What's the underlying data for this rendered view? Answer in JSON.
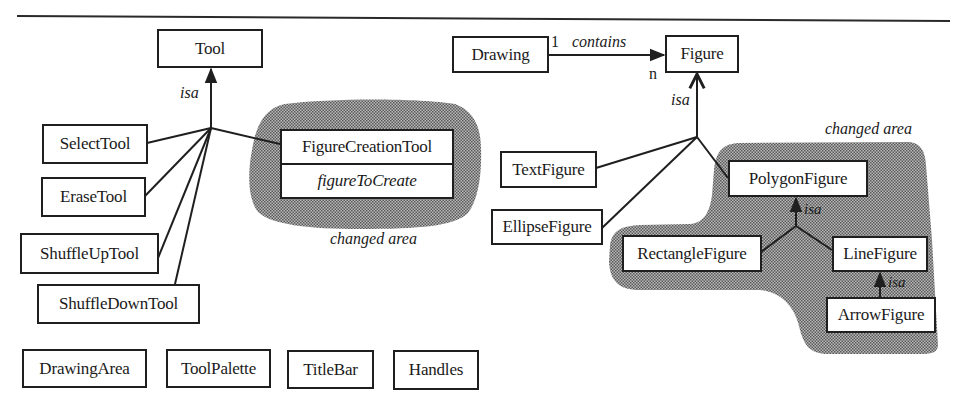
{
  "colors": {
    "ink": "#1f1f1f",
    "changed_area_fill": "#8a8a8a",
    "background": "#ffffff"
  },
  "tool_hierarchy": {
    "root": {
      "label": "Tool"
    },
    "relation_label": "isa",
    "subclasses": [
      {
        "label": "SelectTool"
      },
      {
        "label": "EraseTool"
      },
      {
        "label": "ShuffleUpTool"
      },
      {
        "label": "ShuffleDownTool"
      }
    ],
    "changed_class": {
      "label": "FigureCreationTool",
      "attribute": "figureToCreate"
    },
    "changed_area_label": "changed area"
  },
  "figure_hierarchy": {
    "container": {
      "label": "Drawing"
    },
    "association": {
      "label": "contains",
      "source_multiplicity": "1",
      "target_multiplicity": "n"
    },
    "root": {
      "label": "Figure"
    },
    "relation_label": "isa",
    "subclasses": [
      {
        "label": "TextFigure"
      },
      {
        "label": "EllipseFigure"
      }
    ],
    "changed_area": {
      "label": "changed area",
      "polygon": {
        "label": "PolygonFigure"
      },
      "polygon_relation_label": "isa",
      "rectangle": {
        "label": "RectangleFigure"
      },
      "line": {
        "label": "LineFigure"
      },
      "line_relation_label": "isa",
      "arrow": {
        "label": "ArrowFigure"
      }
    }
  },
  "standalone_classes": [
    {
      "label": "DrawingArea"
    },
    {
      "label": "ToolPalette"
    },
    {
      "label": "TitleBar"
    },
    {
      "label": "Handles"
    }
  ]
}
